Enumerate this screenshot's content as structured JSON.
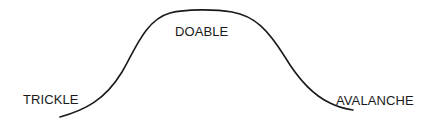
{
  "diagram": {
    "type": "bell-curve",
    "stroke_color": "#1a1a1a",
    "labels": {
      "left": "TRICKLE",
      "peak": "DOABLE",
      "right": "AVALANCHE"
    }
  }
}
